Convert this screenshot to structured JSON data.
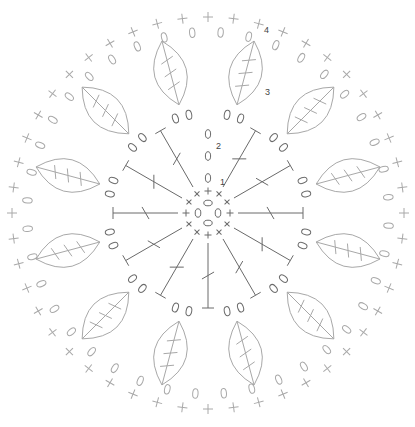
{
  "diagram": {
    "type": "crochet-chart",
    "title": "",
    "width": 415,
    "height": 427,
    "center": {
      "x": 208,
      "y": 213
    },
    "colors": {
      "inner_stroke": "#6a6a6a",
      "outer_stroke": "#a8a8a8",
      "label": "#444444",
      "background": "#ffffff"
    },
    "round_labels": [
      {
        "text": "1",
        "x": 220,
        "y": 185
      },
      {
        "text": "2",
        "x": 216,
        "y": 149
      },
      {
        "text": "3",
        "x": 265,
        "y": 95
      },
      {
        "text": "4",
        "x": 264,
        "y": 33
      }
    ],
    "rounds": {
      "center_chain_ring": {
        "count": 4,
        "radius": 10,
        "symbol": "chain-oval"
      },
      "round_1_single_crochet": {
        "count": 12,
        "radius": 22,
        "symbol": "single-crochet-x"
      },
      "round_2_trebles": {
        "count": 11,
        "start_radius": 30,
        "end_radius": 95,
        "symbol": "treble-crochet",
        "start_chain_column": {
          "angle": -90,
          "ovals": 3
        }
      },
      "round_2_chain_arcs": {
        "count": 24,
        "radius": 100,
        "symbol": "chain-oval"
      },
      "round_3_leaves": {
        "count": 12,
        "inner_radius": 112,
        "outer_radius": 178,
        "symbol": "leaf-petal"
      },
      "round_4_chain_ring": {
        "count": 40,
        "radius": 181,
        "symbol": "chain-oval"
      },
      "round_4_single_crochet_ring": {
        "count": 48,
        "radius": 196,
        "symbol": "single-crochet-plus"
      }
    }
  }
}
